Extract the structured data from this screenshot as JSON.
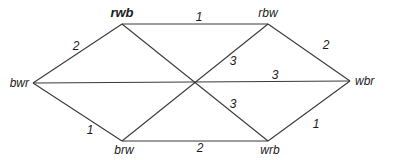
{
  "diagram": {
    "nodes": [
      {
        "id": "rwb",
        "label": "rwb",
        "bold": true,
        "x": 122,
        "y": 24,
        "lx": 122,
        "ly": 17,
        "anchor": "middle"
      },
      {
        "id": "rbw",
        "label": "rbw",
        "bold": false,
        "x": 268,
        "y": 24,
        "lx": 268,
        "ly": 17,
        "anchor": "middle"
      },
      {
        "id": "bwr",
        "label": "bwr",
        "bold": false,
        "x": 33,
        "y": 83,
        "lx": 29,
        "ly": 87,
        "anchor": "end"
      },
      {
        "id": "wbr",
        "label": "wbr",
        "bold": false,
        "x": 350,
        "y": 81,
        "lx": 355,
        "ly": 85,
        "anchor": "start"
      },
      {
        "id": "brw",
        "label": "brw",
        "bold": false,
        "x": 122,
        "y": 141,
        "lx": 124,
        "ly": 154,
        "anchor": "middle"
      },
      {
        "id": "wrb",
        "label": "wrb",
        "bold": false,
        "x": 268,
        "y": 141,
        "lx": 270,
        "ly": 154,
        "anchor": "middle"
      }
    ],
    "edges": [
      {
        "from": "rwb",
        "to": "rbw",
        "weight": "1",
        "lx": 199,
        "ly": 21
      },
      {
        "from": "rwb",
        "to": "bwr",
        "weight": "2",
        "lx": 76,
        "ly": 50
      },
      {
        "from": "rbw",
        "to": "wbr",
        "weight": "2",
        "lx": 326,
        "ly": 49
      },
      {
        "from": "bwr",
        "to": "wbr",
        "weight": "3",
        "lx": 275,
        "ly": 79
      },
      {
        "from": "rbw",
        "to": "brw",
        "weight": "3",
        "lx": 233,
        "ly": 65
      },
      {
        "from": "rwb",
        "to": "wrb",
        "weight": "3",
        "lx": 233,
        "ly": 108
      },
      {
        "from": "bwr",
        "to": "brw",
        "weight": "1",
        "lx": 90,
        "ly": 134
      },
      {
        "from": "brw",
        "to": "wrb",
        "weight": "2",
        "lx": 200,
        "ly": 152
      },
      {
        "from": "wrb",
        "to": "wbr",
        "weight": "1",
        "lx": 316,
        "ly": 128
      }
    ]
  }
}
